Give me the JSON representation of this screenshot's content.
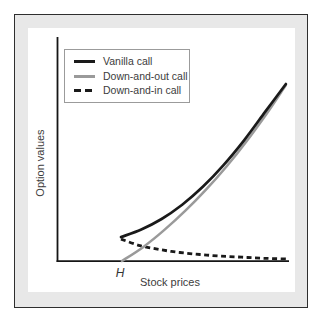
{
  "figure": {
    "type": "textbook-chart",
    "background_color": "#ffffff",
    "matte_color": "#e8e8e8",
    "frame_border_color": "#2e2e2e",
    "axis_color": "#161616",
    "text_color": "#3c3c3c"
  },
  "chart_data": {
    "type": "line",
    "title": "",
    "xlabel": "Stock prices",
    "ylabel": "Option values",
    "legend_position": "top-left",
    "grid": false,
    "x_axis": {
      "min": 0,
      "max": 10.3,
      "ticks": [],
      "barrier_label": "H",
      "barrier_x": 2.81
    },
    "y_axis": {
      "min": 0,
      "max": 10,
      "ticks": []
    },
    "note": "Qualitative figure: no numeric tick labels; values in arbitrary units. Vanilla call = down-and-out call + down-and-in call; H is the barrier level.",
    "series": [
      {
        "name": "Vanilla call",
        "style": "solid",
        "color": "#1a1a1a",
        "dash": "",
        "width": 2.7,
        "points": [
          [
            2.77,
            1.07
          ],
          [
            3.65,
            1.41
          ],
          [
            4.53,
            1.88
          ],
          [
            5.42,
            2.52
          ],
          [
            6.31,
            3.32
          ],
          [
            7.2,
            4.28
          ],
          [
            8.1,
            5.4
          ],
          [
            9.01,
            6.67
          ],
          [
            9.91,
            7.92
          ]
        ]
      },
      {
        "name": "Down-and-out call",
        "style": "solid",
        "color": "#9a9a9a",
        "dash": "",
        "width": 2.5,
        "points": [
          [
            2.81,
            0.0
          ],
          [
            3.74,
            0.63
          ],
          [
            4.65,
            1.39
          ],
          [
            5.56,
            2.25
          ],
          [
            6.45,
            3.19
          ],
          [
            7.33,
            4.22
          ],
          [
            8.2,
            5.35
          ],
          [
            9.06,
            6.57
          ],
          [
            9.91,
            7.87
          ]
        ]
      },
      {
        "name": "Down-and-in call",
        "style": "dashed",
        "color": "#1a1a1a",
        "dash": "5 3.5",
        "width": 2.8,
        "points": [
          [
            2.77,
            0.98
          ],
          [
            3.59,
            0.69
          ],
          [
            4.46,
            0.51
          ],
          [
            5.32,
            0.38
          ],
          [
            6.19,
            0.29
          ],
          [
            7.06,
            0.22
          ],
          [
            8.01,
            0.17
          ],
          [
            8.96,
            0.12
          ],
          [
            9.96,
            0.09
          ]
        ]
      }
    ]
  }
}
